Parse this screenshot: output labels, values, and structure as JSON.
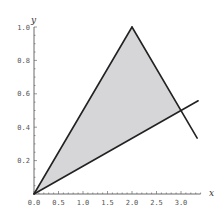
{
  "chart_data": {
    "type": "line",
    "title": "",
    "xlabel": "x",
    "ylabel": "y",
    "xlim": [
      0,
      3.4
    ],
    "ylim": [
      0,
      1.0
    ],
    "x_ticks": [
      "0.0",
      "0.5",
      "1.0",
      "1.5",
      "2.0",
      "2.5",
      "3.0"
    ],
    "y_ticks": [
      "0.2",
      "0.4",
      "0.6",
      "0.8",
      "1.0"
    ],
    "grid": false,
    "legend": null,
    "series": [
      {
        "name": "y = x/2",
        "x": [
          0,
          2
        ],
        "y": [
          0,
          1
        ]
      },
      {
        "name": "y = 2 - x/2",
        "x": [
          2,
          3.33
        ],
        "y": [
          1,
          0.335
        ]
      },
      {
        "name": "y = x/6",
        "x": [
          0,
          3.35
        ],
        "y": [
          0,
          0.558
        ]
      }
    ],
    "shaded_region": {
      "vertices": [
        [
          0,
          0
        ],
        [
          2,
          1
        ],
        [
          3,
          0.5
        ]
      ],
      "fill": "#d6d6d8"
    },
    "line_color": "#222222"
  }
}
